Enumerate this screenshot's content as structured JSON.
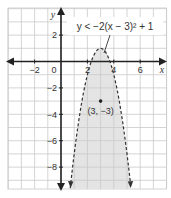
{
  "chart_data": {
    "type": "line",
    "title": "",
    "xlabel": "x",
    "ylabel": "y",
    "xlim": [
      -4,
      8
    ],
    "ylim": [
      -9.7,
      4
    ],
    "grid": true,
    "x_ticks": [
      -2,
      0,
      2,
      4,
      6
    ],
    "y_ticks": [
      2,
      -2,
      -4,
      -6,
      -8
    ],
    "x_tick_labels": [
      "−2",
      "0",
      "2",
      "4",
      "6"
    ],
    "y_tick_labels": [
      "2",
      "−2",
      "−4",
      "−6",
      "−8"
    ],
    "series": [
      {
        "name": "y < −2(x − 3)² + 1",
        "kind": "parabola",
        "a": -2,
        "h": 3,
        "k": 1,
        "style": "dashed",
        "shaded": "inside (below curve)"
      }
    ],
    "annotations": [
      {
        "text": "y < −2(x − 3)² + 1",
        "points_to": "curve near vertex"
      },
      {
        "text": "(3, −3)",
        "point": [
          3,
          -3
        ],
        "marker": "dot"
      }
    ],
    "colors": {
      "shade": "#e3e3e3",
      "grid": "#c8c8c8",
      "axis": "#222222",
      "curve": "#333333"
    }
  },
  "labels": {
    "x_axis": "x",
    "y_axis": "y",
    "equation": "y < −2(x − 3)² + 1",
    "test_point": "(3, −3)",
    "origin": "0",
    "xt_neg2": "−2",
    "xt_2": "2",
    "xt_4": "4",
    "xt_6": "6",
    "yt_2": "2",
    "yt_neg2": "−2",
    "yt_neg4": "−4",
    "yt_neg6": "−6",
    "yt_neg8": "−8"
  }
}
